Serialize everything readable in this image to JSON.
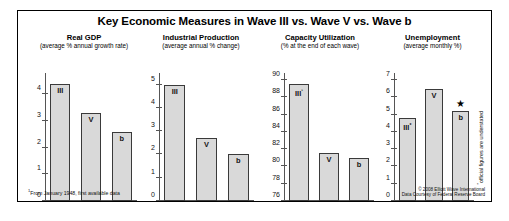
{
  "figure": {
    "title": "Key Economic Measures in Wave III vs. Wave V vs. Wave b",
    "credit_line1": "© 2008 Elliott Wave International",
    "credit_line2": "Data Courtesy of Federal Reserve Board",
    "footnote_gdp": "From January 1948, first available data",
    "footnote_gdp_marker": "1",
    "vertical_note": "official figures are understated",
    "vertical_note_marker": "*",
    "star_glyph": "★"
  },
  "chart_data": [
    {
      "type": "bar",
      "title": "Real GDP",
      "subtitle": "(average % annual growth rate)",
      "xlabel": "",
      "ylabel": "",
      "categories": [
        "III",
        "V",
        "b"
      ],
      "bar_labels": [
        "III",
        "V",
        "b"
      ],
      "values": [
        4.4,
        3.3,
        2.6
      ],
      "ylim": [
        0,
        4.8
      ],
      "yticks": [
        0,
        1,
        2,
        3,
        4
      ],
      "ytick_labels": [
        "0",
        "1",
        "2",
        "3",
        "4"
      ],
      "grid": false,
      "legend": "none"
    },
    {
      "type": "bar",
      "title": "Industrial Production",
      "subtitle": "(average annual % change)",
      "xlabel": "",
      "ylabel": "",
      "categories": [
        "III",
        "V",
        "b"
      ],
      "bar_labels": [
        "III",
        "V",
        "b"
      ],
      "values": [
        5.0,
        2.7,
        2.0
      ],
      "ylim": [
        0,
        5.5
      ],
      "yticks": [
        0,
        1,
        2,
        3,
        4,
        5
      ],
      "ytick_labels": [
        "0",
        "1",
        "2",
        "3",
        "4",
        "5"
      ],
      "grid": false,
      "legend": "none"
    },
    {
      "type": "bar",
      "title": "Capacity Utilization",
      "subtitle": "(% at the end of each wave)",
      "xlabel": "",
      "ylabel": "",
      "categories": [
        "III",
        "V",
        "b"
      ],
      "bar_labels": [
        "III¹",
        "V",
        "b"
      ],
      "values": [
        89.5,
        81.5,
        81.0
      ],
      "ylim": [
        76,
        90.8
      ],
      "yticks": [
        76,
        78,
        80,
        82,
        84,
        86,
        88,
        90
      ],
      "ytick_labels": [
        "76",
        "78",
        "80",
        "82",
        "84",
        "86",
        "88",
        "90"
      ],
      "grid": false,
      "legend": "none"
    },
    {
      "type": "bar",
      "title": "Unemployment",
      "subtitle": "(average monthly %)",
      "xlabel": "",
      "ylabel": "",
      "categories": [
        "III",
        "V",
        "b"
      ],
      "bar_labels": [
        "III*",
        "V",
        "b"
      ],
      "values": [
        4.8,
        6.5,
        5.2
      ],
      "ylim": [
        0,
        7.4
      ],
      "yticks": [
        0,
        1,
        2,
        3,
        4,
        5,
        6,
        7
      ],
      "ytick_labels": [
        "0",
        "1",
        "2",
        "3",
        "4",
        "5",
        "6",
        "7"
      ],
      "grid": false,
      "legend": "none",
      "annotations": [
        {
          "label": "★",
          "on": "b"
        }
      ]
    }
  ]
}
